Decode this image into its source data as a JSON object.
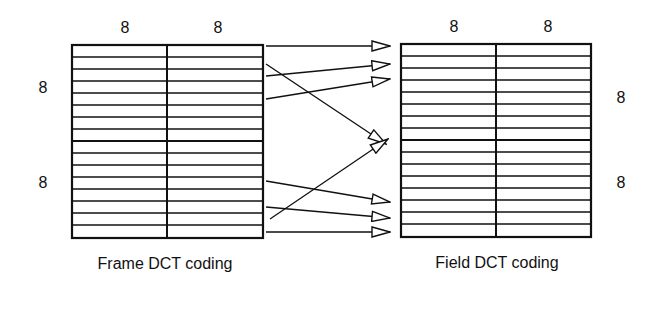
{
  "diagram": {
    "left_block": {
      "caption": "Frame DCT coding",
      "top_labels": [
        "8",
        "8"
      ],
      "side_labels": [
        "8",
        "8"
      ],
      "columns": 2,
      "rows_per_block": 8,
      "blocks_vertical": 2
    },
    "right_block": {
      "caption": "Field DCT coding",
      "top_labels": [
        "8",
        "8"
      ],
      "side_labels": [
        "8",
        "8"
      ],
      "columns": 2,
      "rows_per_block": 8,
      "blocks_vertical": 2
    },
    "arrows": [
      {
        "from": "frame-line-1",
        "to": "field-line-1"
      },
      {
        "from": "frame-line-2",
        "to": "field-line-9"
      },
      {
        "from": "frame-line-3",
        "to": "field-line-2"
      },
      {
        "from": "frame-line-5",
        "to": "field-line-3"
      },
      {
        "from": "frame-line-12",
        "to": "field-line-14"
      },
      {
        "from": "frame-line-14",
        "to": "field-line-15"
      },
      {
        "from": "frame-line-15",
        "to": "field-line-9"
      },
      {
        "from": "frame-line-16",
        "to": "field-line-16"
      }
    ],
    "colors": {
      "line": "#111111",
      "background": "#ffffff"
    }
  }
}
